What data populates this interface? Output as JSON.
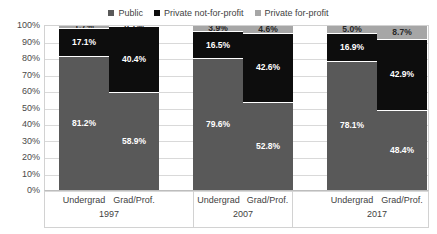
{
  "legend": {
    "position": "top-center",
    "items": [
      {
        "label": "Public",
        "color": "#595959",
        "icon": "square-marker-icon"
      },
      {
        "label": "Private not-for-profit",
        "color": "#0d0d0d",
        "icon": "square-marker-icon"
      },
      {
        "label": "Private for-profit",
        "color": "#a6a6a6",
        "icon": "square-marker-icon"
      }
    ]
  },
  "axis": {
    "y_ticks": [
      "100%",
      "90%",
      "80%",
      "70%",
      "60%",
      "50%",
      "40%",
      "30%",
      "20%",
      "10%",
      "0%"
    ]
  },
  "chart_data": {
    "type": "bar",
    "title": "",
    "subtitle": "",
    "xlabel": "",
    "ylabel": "",
    "ylim": [
      0,
      100
    ],
    "stacked": true,
    "normalized_100": true,
    "grid": true,
    "legend_position": "top",
    "categories": [
      "Undergrad 1997",
      "Grad/Prof. 1997",
      "Undergrad 2007",
      "Grad/Prof. 2007",
      "Undergrad 2017",
      "Grad/Prof. 2017"
    ],
    "groups": [
      {
        "year": "1997",
        "bars": [
          {
            "label": "Undergrad",
            "segments": [
              {
                "name": "Public",
                "value": 81.2,
                "display": "81.2%"
              },
              {
                "name": "Private not-for-profit",
                "value": 17.1,
                "display": "17.1%"
              },
              {
                "name": "Private for-profit",
                "value": 1.7,
                "display": "1.7%"
              }
            ]
          },
          {
            "label": "Grad/Prof.",
            "segments": [
              {
                "name": "Public",
                "value": 58.9,
                "display": "58.9%"
              },
              {
                "name": "Private not-for-profit",
                "value": 40.4,
                "display": "40.4%"
              },
              {
                "name": "Private for-profit",
                "value": 0.7,
                "display": "0.7%"
              }
            ]
          }
        ]
      },
      {
        "year": "2007",
        "bars": [
          {
            "label": "Undergrad",
            "segments": [
              {
                "name": "Public",
                "value": 79.6,
                "display": "79.6%"
              },
              {
                "name": "Private not-for-profit",
                "value": 16.5,
                "display": "16.5%"
              },
              {
                "name": "Private for-profit",
                "value": 3.9,
                "display": "3.9%"
              }
            ]
          },
          {
            "label": "Grad/Prof.",
            "segments": [
              {
                "name": "Public",
                "value": 52.8,
                "display": "52.8%"
              },
              {
                "name": "Private not-for-profit",
                "value": 42.6,
                "display": "42.6%"
              },
              {
                "name": "Private for-profit",
                "value": 4.6,
                "display": "4.6%"
              }
            ]
          }
        ]
      },
      {
        "year": "2017",
        "bars": [
          {
            "label": "Undergrad",
            "segments": [
              {
                "name": "Public",
                "value": 78.1,
                "display": "78.1%"
              },
              {
                "name": "Private not-for-profit",
                "value": 16.9,
                "display": "16.9%"
              },
              {
                "name": "Private for-profit",
                "value": 5.0,
                "display": "5.0%"
              }
            ]
          },
          {
            "label": "Grad/Prof.",
            "segments": [
              {
                "name": "Public",
                "value": 48.4,
                "display": "48.4%"
              },
              {
                "name": "Private not-for-profit",
                "value": 42.9,
                "display": "42.9%"
              },
              {
                "name": "Private for-profit",
                "value": 8.7,
                "display": "8.7%"
              }
            ]
          }
        ]
      }
    ],
    "series": [
      {
        "name": "Public",
        "color": "#595959",
        "values": [
          81.2,
          58.9,
          79.6,
          52.8,
          78.1,
          48.4
        ]
      },
      {
        "name": "Private not-for-profit",
        "color": "#0d0d0d",
        "values": [
          17.1,
          40.4,
          16.5,
          42.6,
          16.9,
          42.9
        ]
      },
      {
        "name": "Private for-profit",
        "color": "#a6a6a6",
        "values": [
          1.7,
          0.7,
          3.9,
          4.6,
          5.0,
          8.7
        ]
      }
    ]
  }
}
